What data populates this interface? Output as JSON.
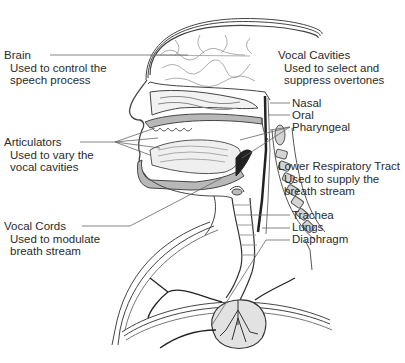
{
  "diagram": {
    "labels": {
      "brain": {
        "title": "Brain",
        "desc1": "Used to control the",
        "desc2": "speech process"
      },
      "articulators": {
        "title": "Articulators",
        "desc1": "Used to vary the",
        "desc2": "vocal cavities"
      },
      "vocal_cords": {
        "title": "Vocal Cords",
        "desc1": "Used to modulate",
        "desc2": "breath stream"
      },
      "vocal_cavities": {
        "title": "Vocal Cavities",
        "desc1": "Used to select and",
        "desc2": "suppress overtones"
      },
      "cavity_parts": [
        "Nasal",
        "Oral",
        "Pharyngeal"
      ],
      "lower_respiratory": {
        "title": "Lower Respiratory Tract",
        "desc1": "Used to supply the",
        "desc2": "breath stream"
      },
      "respiratory_parts": [
        "Trachea",
        "Lungs",
        "Diaphragm"
      ]
    },
    "colors": {
      "line": "#555555",
      "fill_gray": "#b8b8b8",
      "dark": "#222222",
      "background": "#ffffff"
    }
  }
}
